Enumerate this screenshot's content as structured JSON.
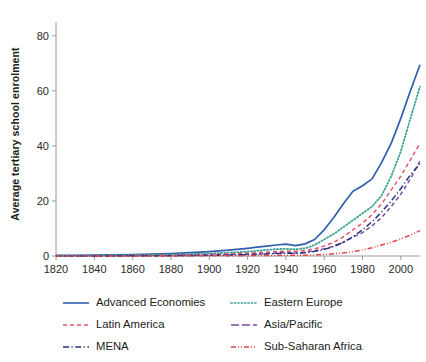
{
  "chart_data": {
    "type": "line",
    "title": "",
    "xlabel": "",
    "ylabel": "Average tertiary school enrolment",
    "xlim": [
      1820,
      2010
    ],
    "ylim": [
      0,
      85
    ],
    "grid": false,
    "legend_position": "bottom",
    "xticks": [
      1820,
      1840,
      1860,
      1880,
      1900,
      1920,
      1940,
      1960,
      1980,
      2000
    ],
    "yticks": [
      0,
      20,
      40,
      60,
      80
    ],
    "x": [
      1820,
      1830,
      1840,
      1850,
      1860,
      1870,
      1880,
      1890,
      1900,
      1910,
      1920,
      1925,
      1930,
      1935,
      1940,
      1945,
      1950,
      1955,
      1960,
      1965,
      1970,
      1975,
      1980,
      1985,
      1990,
      1995,
      2000,
      2005,
      2010
    ],
    "series": [
      {
        "name": "Advanced Economies",
        "color": "#2f5fad",
        "style": "solid",
        "values": [
          0.2,
          0.25,
          0.3,
          0.4,
          0.5,
          0.7,
          0.9,
          1.2,
          1.6,
          2.1,
          2.8,
          3.2,
          3.6,
          4.0,
          4.3,
          3.8,
          4.4,
          6.0,
          9.5,
          14.0,
          19.0,
          23.5,
          25.5,
          28.0,
          34.0,
          41.0,
          50.0,
          60.0,
          69.5
        ]
      },
      {
        "name": "Eastern Europe",
        "color": "#3aa394",
        "style": "dotted",
        "values": [
          0.1,
          0.12,
          0.15,
          0.2,
          0.25,
          0.35,
          0.5,
          0.7,
          0.9,
          1.2,
          1.6,
          1.9,
          2.2,
          2.5,
          2.6,
          2.4,
          2.8,
          4.0,
          6.0,
          8.0,
          10.5,
          13.0,
          15.5,
          18.0,
          22.0,
          29.0,
          38.0,
          50.0,
          61.5
        ]
      },
      {
        "name": "Latin America",
        "color": "#e8536b",
        "style": "dashed",
        "values": [
          0.05,
          0.06,
          0.08,
          0.1,
          0.15,
          0.2,
          0.3,
          0.4,
          0.6,
          0.8,
          1.0,
          1.2,
          1.4,
          1.6,
          1.8,
          1.7,
          2.0,
          2.6,
          3.6,
          5.0,
          7.0,
          9.5,
          12.0,
          15.0,
          19.0,
          24.0,
          29.0,
          35.0,
          41.0
        ]
      },
      {
        "name": "Asia/Pacific",
        "color": "#7b4a9e",
        "style": "dashed",
        "values": [
          0.02,
          0.03,
          0.04,
          0.05,
          0.08,
          0.1,
          0.15,
          0.2,
          0.3,
          0.45,
          0.6,
          0.7,
          0.9,
          1.1,
          1.2,
          1.1,
          1.4,
          1.9,
          2.6,
          3.6,
          5.0,
          6.8,
          8.5,
          11.0,
          14.0,
          18.0,
          22.5,
          28.0,
          34.5
        ]
      },
      {
        "name": "MENA",
        "color": "#27347a",
        "style": "dashdot",
        "values": [
          0.02,
          0.02,
          0.03,
          0.04,
          0.06,
          0.08,
          0.12,
          0.18,
          0.25,
          0.35,
          0.5,
          0.6,
          0.75,
          0.9,
          1.0,
          0.95,
          1.2,
          1.7,
          2.4,
          3.4,
          5.0,
          7.0,
          9.5,
          12.5,
          16.0,
          20.0,
          24.5,
          29.5,
          33.5
        ]
      },
      {
        "name": "Sub-Saharan Africa",
        "color": "#e2464a",
        "style": "dashdotdot",
        "values": [
          0.01,
          0.01,
          0.01,
          0.02,
          0.02,
          0.03,
          0.04,
          0.05,
          0.07,
          0.1,
          0.13,
          0.15,
          0.18,
          0.2,
          0.25,
          0.25,
          0.3,
          0.4,
          0.55,
          0.8,
          1.1,
          1.6,
          2.2,
          3.0,
          4.0,
          5.0,
          6.2,
          7.6,
          9.2
        ]
      }
    ]
  },
  "axes": {
    "ylabel": "Average tertiary school enrolment"
  },
  "legend": {
    "items": [
      {
        "label": "Advanced Economies"
      },
      {
        "label": "Eastern Europe"
      },
      {
        "label": "Latin America"
      },
      {
        "label": "Asia/Pacific"
      },
      {
        "label": "MENA"
      },
      {
        "label": "Sub-Saharan Africa"
      }
    ]
  }
}
